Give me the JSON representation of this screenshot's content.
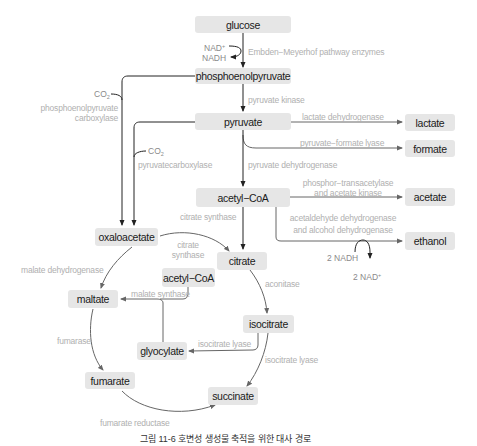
{
  "diagram": {
    "type": "metabolic-pathway",
    "nodes": {
      "glucose": "glucose",
      "pep": "phosphoenolpyruvate",
      "pyruvate": "pyruvate",
      "lactate": "lactate",
      "formate": "formate",
      "acetyl_coa": "acetyl−CoA",
      "acetate": "acetate",
      "ethanol": "ethanol",
      "oxaloacetate": "oxaloacetate",
      "citrate": "citrate",
      "acetyl_coa_2": "acetyl−CoA",
      "maltate": "maltate",
      "isocitrate": "isocitrate",
      "glyocylate": "glyocylate",
      "fumarate": "fumarate",
      "succinate": "succinate"
    },
    "enzymes": {
      "embden_meyerhof": "Embden−Meyerhof pathway enzymes",
      "pyruvate_kinase": "pyruvate kinase",
      "lactate_dh": "lactate dehydrogenase",
      "pfl": "pyruvate−formate lyase",
      "pdh": "pyruvate dehydrogenase",
      "pta_line1": "phosphor−transacetylase",
      "pta_line2": "and acetate kinase",
      "adh_line1": "acetaldehyde dehydrogenase",
      "adh_line2": "and alcohol dehydrogenase",
      "pepc_line1": "phosphoenolpyruvate",
      "pepc_line2": "carboxylase",
      "pyc": "pyruvatecarboxylase",
      "citrate_synthase": "citrate synthase",
      "citrate_synthase_2_line1": "citrate",
      "citrate_synthase_2_line2": "synthase",
      "malate_dh": "malate dehydrogenase",
      "malate_synthase": "malate synthase",
      "aconitase": "aconitase",
      "isocitrate_lyase_1": "isocitrate lyase",
      "isocitrate_lyase_2": "isocitrate lyase",
      "fumarase": "fumarase",
      "fumarate_reductase": "fumarate reductase"
    },
    "cofactors": {
      "nad_plus": "NAD",
      "nad_plus_sup": "+",
      "nadh": "NADH",
      "co2_a": "CO",
      "co2_a_sub": "2",
      "co2_b": "CO",
      "co2_b_sub": "2",
      "two_nadh": "2 NADH",
      "two_nad_plus": "2 NAD",
      "two_nad_plus_sup": "+"
    },
    "caption": "그림 11-6 호변성 생성물 축적을 위한 대사 경로",
    "colors": {
      "node_fill": "#e6e6e6",
      "node_text": "#1a1a1a",
      "enzyme_text": "#b0b0b0",
      "arrow_dark": "#222222",
      "arrow_gray": "#777777"
    }
  }
}
